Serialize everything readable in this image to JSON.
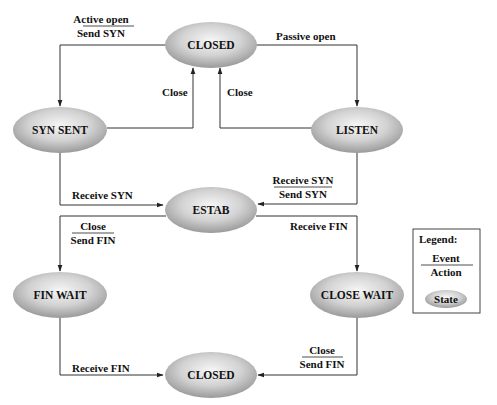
{
  "diagram": {
    "states": [
      {
        "id": "closed_top",
        "label": "CLOSED",
        "cx": 211,
        "cy": 45
      },
      {
        "id": "syn_sent",
        "label": "SYN SENT",
        "cx": 60,
        "cy": 130
      },
      {
        "id": "listen",
        "label": "LISTEN",
        "cx": 357,
        "cy": 130
      },
      {
        "id": "estab",
        "label": "ESTAB",
        "cx": 211,
        "cy": 210
      },
      {
        "id": "fin_wait",
        "label": "FIN WAIT",
        "cx": 60,
        "cy": 295
      },
      {
        "id": "close_wait",
        "label": "CLOSE WAIT",
        "cx": 357,
        "cy": 295
      },
      {
        "id": "closed_bottom",
        "label": "CLOSED",
        "cx": 211,
        "cy": 375
      }
    ],
    "transitions": [
      {
        "from": "closed_top",
        "to": "syn_sent",
        "event": "Active open",
        "action": "Send SYN"
      },
      {
        "from": "closed_top",
        "to": "listen",
        "event": "Passive open",
        "action": ""
      },
      {
        "from": "syn_sent",
        "to": "closed_top",
        "event": "Close",
        "action": ""
      },
      {
        "from": "listen",
        "to": "closed_top",
        "event": "Close",
        "action": ""
      },
      {
        "from": "syn_sent",
        "to": "estab",
        "event": "Receive SYN",
        "action": ""
      },
      {
        "from": "listen",
        "to": "estab",
        "event": "Receive SYN",
        "action": "Send SYN"
      },
      {
        "from": "estab",
        "to": "fin_wait",
        "event": "Close",
        "action": "Send FIN"
      },
      {
        "from": "estab",
        "to": "close_wait",
        "event": "Receive FIN",
        "action": ""
      },
      {
        "from": "fin_wait",
        "to": "closed_bottom",
        "event": "Receive FIN",
        "action": ""
      },
      {
        "from": "close_wait",
        "to": "closed_bottom",
        "event": "Close",
        "action": "Send FIN"
      }
    ]
  },
  "labels": {
    "active_open_event": "Active open",
    "active_open_action": "Send SYN",
    "passive_open": "Passive open",
    "close_left": "Close",
    "close_right": "Close",
    "syn_sent_receive_syn": "Receive SYN",
    "listen_receive_syn_event": "Receive SYN",
    "listen_receive_syn_action": "Send SYN",
    "estab_close_event": "Close",
    "estab_close_action": "Send FIN",
    "estab_receive_fin": "Receive FIN",
    "fin_wait_receive_fin": "Receive FIN",
    "close_wait_close_event": "Close",
    "close_wait_close_action": "Send FIN"
  },
  "states": {
    "closed_top": "CLOSED",
    "syn_sent": "SYN SENT",
    "listen": "LISTEN",
    "estab": "ESTAB",
    "fin_wait": "FIN WAIT",
    "close_wait": "CLOSE WAIT",
    "closed_bottom": "CLOSED"
  },
  "legend": {
    "title": "Legend:",
    "event": "Event",
    "action": "Action",
    "state": "State"
  },
  "colors": {
    "state_fill_light": "#f4f4f4",
    "state_fill_dark": "#9a9a9a",
    "line": "#333333",
    "text": "#111111"
  }
}
